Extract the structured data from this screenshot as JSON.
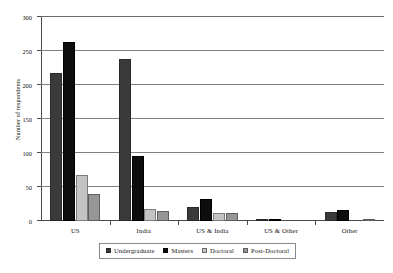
{
  "chart_data": {
    "type": "bar",
    "title": "",
    "subtitle": "",
    "xlabel": "",
    "ylabel": "Number of respondents",
    "ylim": [
      0,
      300
    ],
    "yticks": [
      0,
      50,
      100,
      150,
      200,
      250,
      300
    ],
    "grid": true,
    "legend_position": "bottom",
    "categories": [
      "US",
      "India",
      "US & India",
      "US & Other",
      "Other"
    ],
    "series": [
      {
        "name": "Undergraduate",
        "color": "#3a3a3a",
        "values": [
          218,
          238,
          20,
          3,
          13
        ]
      },
      {
        "name": "Masters",
        "color": "#0d0d0d",
        "values": [
          263,
          95,
          33,
          3,
          16
        ]
      },
      {
        "name": "Doctoral",
        "color": "#c3c3c3",
        "values": [
          67,
          17,
          12,
          0,
          0
        ]
      },
      {
        "name": "Post-Doctoral",
        "color": "#969696",
        "values": [
          40,
          15,
          12,
          0,
          2
        ]
      }
    ]
  }
}
